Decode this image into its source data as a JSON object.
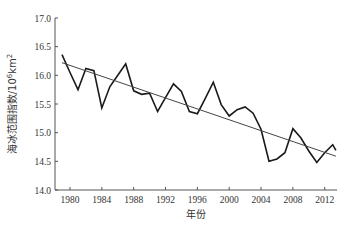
{
  "chart_data": {
    "type": "line",
    "title": "",
    "xlabel": "年份",
    "ylabel": "海冰范围指数/10⁶km²",
    "ylabel_parts": {
      "base": "海冰范围指数/10",
      "exp1": "6",
      "mid": "km",
      "exp2": "2"
    },
    "xlim": [
      1977.9,
      2013.4
    ],
    "ylim": [
      14.0,
      17.0
    ],
    "x_ticks": [
      1980,
      1984,
      1988,
      1992,
      1996,
      2000,
      2004,
      2008,
      2012
    ],
    "y_ticks": [
      14.0,
      14.5,
      15.0,
      15.5,
      16.0,
      16.5,
      17.0
    ],
    "y_tick_labels": [
      "14.0",
      "14.5",
      "15.0",
      "15.5",
      "16.0",
      "16.5",
      "17.0"
    ],
    "grid": false,
    "legend": null,
    "series": [
      {
        "name": "海冰范围指数",
        "style": "solid-thick",
        "color": "#1a1a1a",
        "x": [
          1979,
          1980,
          1981,
          1982,
          1983,
          1984,
          1985,
          1986,
          1987,
          1988,
          1989,
          1990,
          1991,
          1992,
          1993,
          1994,
          1995,
          1996,
          1997,
          1998,
          1999,
          2000,
          2001,
          2002,
          2003,
          2004,
          2005,
          2006,
          2007,
          2008,
          2009,
          2010,
          2011,
          2012,
          2013,
          2013.4
        ],
        "values": [
          16.36,
          16.05,
          15.75,
          16.12,
          16.08,
          15.43,
          15.8,
          16.0,
          16.2,
          15.73,
          15.67,
          15.69,
          15.37,
          15.61,
          15.85,
          15.72,
          15.37,
          15.33,
          15.6,
          15.88,
          15.49,
          15.29,
          15.4,
          15.45,
          15.34,
          15.06,
          14.5,
          14.54,
          14.65,
          15.07,
          14.91,
          14.68,
          14.48,
          14.65,
          14.79,
          14.69
        ]
      },
      {
        "name": "线性趋势",
        "style": "solid-thin",
        "color": "#444444",
        "x": [
          1979,
          2013.4
        ],
        "values": [
          16.22,
          14.59
        ]
      }
    ]
  },
  "layout": {
    "plot": {
      "left": 55,
      "right": 337,
      "top": 18,
      "bottom": 190
    },
    "x_px_per_year": 7.96,
    "x_origin_year": 1980,
    "x_origin_px": 70
  }
}
